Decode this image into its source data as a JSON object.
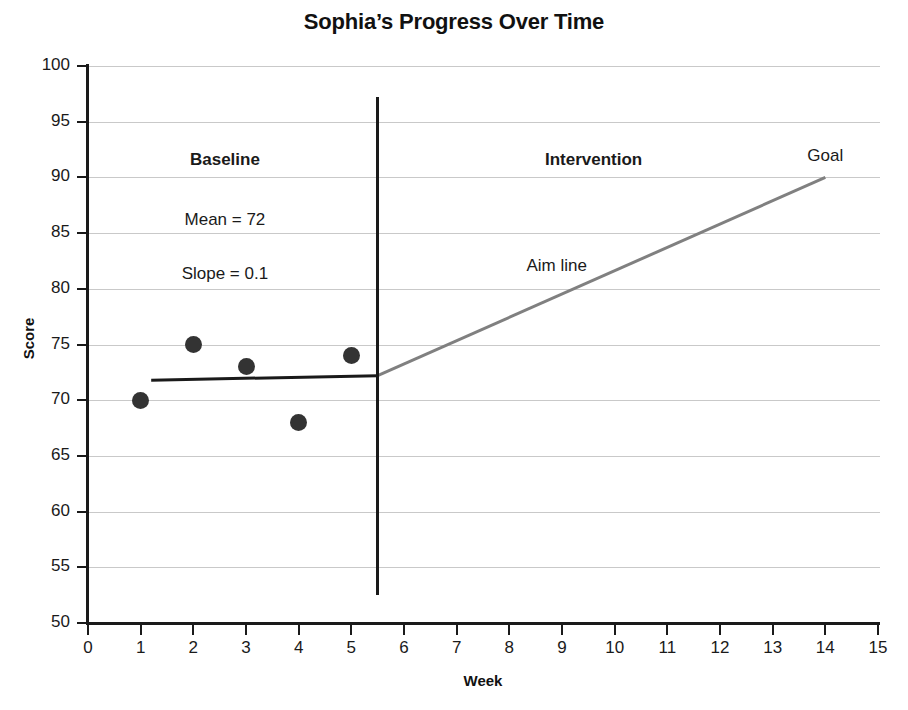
{
  "chart_data": {
    "type": "scatter",
    "title": "Sophia’s Progress Over Time",
    "xlabel": "Week",
    "ylabel": "Score",
    "xlim": [
      0,
      15
    ],
    "ylim": [
      50,
      100
    ],
    "xticks": [
      "0",
      "1",
      "2",
      "3",
      "4",
      "5",
      "6",
      "7",
      "8",
      "9",
      "10",
      "11",
      "12",
      "13",
      "14",
      "15"
    ],
    "yticks": [
      "50",
      "55",
      "60",
      "65",
      "70",
      "75",
      "80",
      "85",
      "90",
      "95",
      "100"
    ],
    "grid": "horizontal",
    "legend": "none",
    "series": [
      {
        "name": "Baseline data points",
        "type": "scatter",
        "marker": "filled-circle",
        "color": "#333333",
        "x": [
          1,
          2,
          3,
          4,
          5
        ],
        "values": [
          70,
          75,
          73,
          68,
          74
        ]
      },
      {
        "name": "Baseline trend line",
        "type": "line",
        "color": "#1a1a1a",
        "x": [
          1.2,
          5.5
        ],
        "values": [
          71.8,
          72.2
        ]
      },
      {
        "name": "Aim line",
        "type": "line",
        "color": "#808080",
        "x": [
          5.5,
          14
        ],
        "values": [
          72.2,
          90
        ]
      }
    ],
    "phase_line": {
      "label": "phase-change-line",
      "x": 5.5,
      "y_from": 52.5,
      "y_to": 97.2
    },
    "annotations": [
      {
        "id": "baseline-label",
        "text": "Baseline",
        "bold": true,
        "x": 2.6,
        "y": 91.5
      },
      {
        "id": "baseline-mean",
        "text": "Mean = 72",
        "bold": false,
        "x": 2.6,
        "y": 86.1
      },
      {
        "id": "baseline-slope",
        "text": "Slope = 0.1",
        "bold": false,
        "x": 2.6,
        "y": 81.2
      },
      {
        "id": "intervention-label",
        "text": "Intervention",
        "bold": true,
        "x": 9.6,
        "y": 91.5
      },
      {
        "id": "goal-label",
        "text": "Goal",
        "bold": false,
        "x": 14.0,
        "y": 91.8
      },
      {
        "id": "aim-line-label",
        "text": "Aim line",
        "bold": false,
        "x": 8.9,
        "y": 82.0
      }
    ]
  }
}
